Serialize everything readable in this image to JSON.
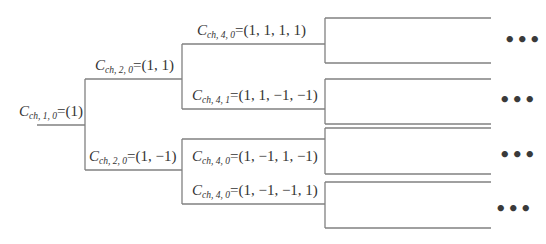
{
  "diagram": {
    "type": "code-tree",
    "nodes": [
      {
        "id": "root",
        "symbol": "C",
        "sub": "ch, 1, 0",
        "eq": "=",
        "value": "(1)"
      },
      {
        "id": "l2-top",
        "symbol": "C",
        "sub": "ch, 2, 0",
        "eq": "=",
        "value": "(1, 1)"
      },
      {
        "id": "l2-bottom",
        "symbol": "C",
        "sub": "ch, 2, 0",
        "eq": "=",
        "value": "(1, −1)"
      },
      {
        "id": "l4-0",
        "symbol": "C",
        "sub": "ch, 4, 0",
        "eq": "=",
        "value": "(1, 1, 1, 1)"
      },
      {
        "id": "l4-1",
        "symbol": "C",
        "sub": "ch, 4, 1",
        "eq": "=",
        "value": "(1, 1, −1, −1)"
      },
      {
        "id": "l4-2",
        "symbol": "C",
        "sub": "ch, 4, 0",
        "eq": "=",
        "value": "(1, −1, 1, −1)"
      },
      {
        "id": "l4-3",
        "symbol": "C",
        "sub": "ch, 4, 0",
        "eq": "=",
        "value": "(1, −1, −1, 1)"
      }
    ],
    "continuation": [
      "•••",
      "•••",
      "•••",
      "•••"
    ],
    "line_color": "#7a7a7a"
  }
}
